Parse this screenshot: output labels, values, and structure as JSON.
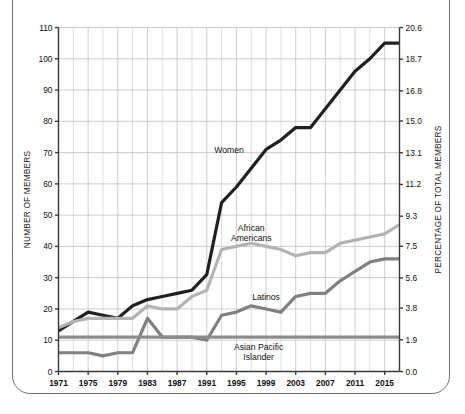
{
  "figure": {
    "frame_color": "#6e6e6e",
    "background": "#ffffff"
  },
  "chart_data": {
    "type": "line",
    "title": "",
    "subtitle": "",
    "xlabel": "",
    "ylabel": "NUMBER OF MEMBERS",
    "y2label": "PERCENTAGE OF TOTAL MEMBERS",
    "grid": true,
    "legend_position": "inline-annotations",
    "xlim": [
      1971,
      2017
    ],
    "ylim": [
      0,
      110
    ],
    "y2lim": [
      0.0,
      20.6
    ],
    "x": [
      1971,
      1973,
      1975,
      1977,
      1979,
      1981,
      1983,
      1985,
      1987,
      1989,
      1991,
      1993,
      1995,
      1997,
      1999,
      2001,
      2003,
      2005,
      2007,
      2009,
      2011,
      2013,
      2015,
      2017
    ],
    "xticks": [
      1971,
      1975,
      1979,
      1983,
      1987,
      1991,
      1995,
      1999,
      2003,
      2007,
      2011,
      2015
    ],
    "xticklabels": [
      "1971",
      "1975",
      "1979",
      "1983",
      "1987",
      "1991",
      "1995",
      "1999",
      "2003",
      "2007",
      "2011",
      "2015"
    ],
    "yticks": [
      0,
      10,
      20,
      30,
      40,
      50,
      60,
      70,
      80,
      90,
      100,
      110
    ],
    "yticklabels": [
      "0",
      "10",
      "20",
      "30",
      "40",
      "50",
      "60",
      "70",
      "80",
      "90",
      "100",
      "110"
    ],
    "y2ticks": [
      0.0,
      1.9,
      3.8,
      5.6,
      7.5,
      9.3,
      11.2,
      13.1,
      15.0,
      16.8,
      18.7,
      20.6
    ],
    "y2ticklabels": [
      "0.0",
      "1.9",
      "3.8",
      "5.6",
      "7.5",
      "9.3",
      "11.2",
      "13.1",
      "15.0",
      "16.8",
      "18.7",
      "20.6"
    ],
    "series": [
      {
        "name": "Women",
        "color": "#231f20",
        "width": 3.2,
        "label_x": 1994,
        "label_y": 70,
        "values": [
          13,
          16,
          19,
          18,
          17,
          21,
          23,
          24,
          25,
          26,
          31,
          54,
          59,
          65,
          71,
          74,
          78,
          78,
          84,
          90,
          96,
          100,
          105,
          105
        ]
      },
      {
        "name": "African Americans",
        "color": "#b3b3b3",
        "width": 3.2,
        "label_x": 1997,
        "label_y": 45,
        "label_lines": [
          "African",
          "Americans"
        ],
        "values": [
          14,
          16,
          17,
          17,
          17,
          17,
          21,
          20,
          20,
          24,
          26,
          39,
          40,
          41,
          40,
          39,
          37,
          38,
          38,
          41,
          42,
          43,
          44,
          47
        ]
      },
      {
        "name": "Latinos",
        "color": "#808080",
        "width": 3.2,
        "label_x": 1999,
        "label_y": 23,
        "values": [
          6,
          6,
          6,
          5,
          6,
          6,
          17,
          11,
          11,
          11,
          10,
          18,
          19,
          21,
          20,
          19,
          24,
          25,
          25,
          29,
          32,
          35,
          36,
          36
        ]
      },
      {
        "name": "Asian Pacific Islander",
        "color": "#8c8c8c",
        "width": 3.2,
        "label_x": 1998,
        "label_y": 7,
        "label_lines": [
          "Asian Pacific",
          "Islander"
        ],
        "values": [
          11,
          11,
          11,
          11,
          11,
          11,
          11,
          11,
          11,
          11,
          11,
          11,
          11,
          11,
          11,
          11,
          11,
          11,
          11,
          11,
          11,
          11,
          11,
          11
        ]
      }
    ]
  }
}
